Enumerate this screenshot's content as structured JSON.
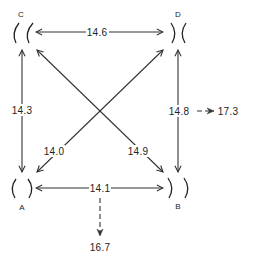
{
  "diagram": {
    "type": "resonator-coupling-network",
    "nodes": [
      {
        "id": "A",
        "label": "A",
        "shape": "facing-out-brackets"
      },
      {
        "id": "B",
        "label": "B",
        "shape": "facing-in-brackets"
      },
      {
        "id": "C",
        "label": "C",
        "shape": "left-open-brackets"
      },
      {
        "id": "D",
        "label": "D",
        "shape": "facing-in-brackets"
      }
    ],
    "edges": [
      {
        "from": "C",
        "to": "D",
        "label": "14.6",
        "style": "double-arrow"
      },
      {
        "from": "A",
        "to": "C",
        "label": "14.3",
        "style": "double-arrow"
      },
      {
        "from": "B",
        "to": "D",
        "label": "14.8",
        "style": "double-arrow"
      },
      {
        "from": "A",
        "to": "B",
        "label": "14.1",
        "style": "double-arrow"
      },
      {
        "from": "C",
        "to": "B",
        "label": "14.9",
        "style": "double-arrow"
      },
      {
        "from": "A",
        "to": "D",
        "label": "14.0",
        "style": "double-arrow"
      }
    ],
    "derived": [
      {
        "from_edge": "B-D",
        "label": "17.3",
        "style": "dashed-arrow",
        "direction": "right"
      },
      {
        "from_edge": "A-B",
        "label": "16.7",
        "style": "dashed-arrow",
        "direction": "down"
      }
    ]
  }
}
